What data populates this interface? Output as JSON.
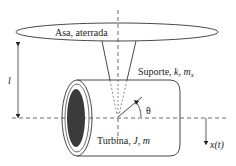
{
  "diagram": {
    "wing_label": "Asa, aterrada",
    "support_label_prefix": "Suporte, ",
    "support_k": "k",
    "support_sep": ", ",
    "support_m": "m",
    "support_sub": "x",
    "length_label": "l",
    "angle_label": "θ",
    "turbine_label_prefix": "Turbina, ",
    "turbine_J": "J",
    "turbine_sep": ", ",
    "turbine_m": "m",
    "displacement_label": "x(t)",
    "colors": {
      "stroke": "#333333",
      "fill_dark": "#3a3a3a",
      "background": "#ffffff"
    }
  }
}
